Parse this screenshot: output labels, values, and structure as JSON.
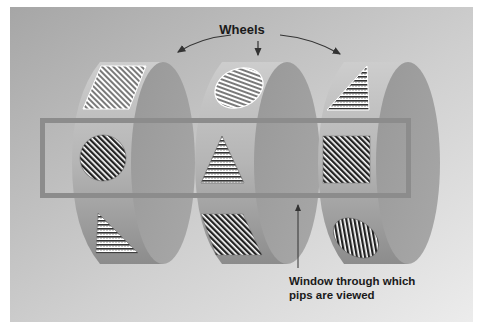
{
  "diagram": {
    "title_label": "Wheels",
    "window_label_line1": "Window through which",
    "window_label_line2": "pips are viewed",
    "colors": {
      "panel_dark": "#a9a9a9",
      "panel_light": "#e8e8e8",
      "wheel_rim": "#b4b4b4",
      "wheel_face": "#9c9c9c",
      "window_frame": "#8a8a8a",
      "arrow": "#333333"
    },
    "wheels": [
      {
        "name": "wheel-1",
        "pips": [
          {
            "position": "top",
            "shape": "parallelogram",
            "pattern": "diagonal-stripes-light"
          },
          {
            "position": "window",
            "shape": "circle",
            "pattern": "diagonal-stripes-dark"
          },
          {
            "position": "bottom",
            "shape": "triangle",
            "pattern": "horizontal-dotted-stripes"
          }
        ]
      },
      {
        "name": "wheel-2",
        "pips": [
          {
            "position": "top",
            "shape": "ellipse",
            "pattern": "diagonal-stripes-light"
          },
          {
            "position": "window",
            "shape": "triangle",
            "pattern": "horizontal-dotted-stripes"
          },
          {
            "position": "bottom",
            "shape": "parallelogram",
            "pattern": "diagonal-stripes-dark"
          }
        ]
      },
      {
        "name": "wheel-3",
        "pips": [
          {
            "position": "top",
            "shape": "triangle",
            "pattern": "horizontal-dotted-stripes"
          },
          {
            "position": "window",
            "shape": "square",
            "pattern": "diagonal-stripes-dark"
          },
          {
            "position": "bottom",
            "shape": "ellipse",
            "pattern": "diagonal-stripes-dark"
          }
        ]
      }
    ]
  }
}
